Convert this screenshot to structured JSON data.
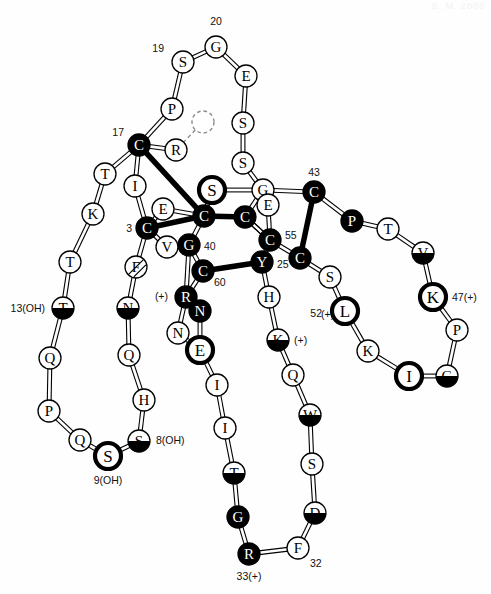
{
  "figure": {
    "type": "protein-residue-topology-diagram",
    "watermark_text": "S. M. 2000",
    "background_color": "#fefefe",
    "stroke_color": "#000000",
    "filled_fill": "#000000",
    "filled_text": "#ffffff",
    "open_fill": "#ffffff",
    "open_text": "#000000"
  },
  "legend": {
    "residue_radius_normal": 11,
    "residue_radius_large": 13,
    "bond_width_normal": 1.1,
    "bond_width_thick": 5.5
  },
  "residues": [
    {
      "id": "r01",
      "label": "G",
      "x": 216,
      "y": 47,
      "style": "open",
      "r": 11,
      "name": "residue-g20"
    },
    {
      "id": "r02",
      "label": "S",
      "x": 183,
      "y": 62,
      "style": "open",
      "r": 11,
      "name": "residue-s19"
    },
    {
      "id": "r03",
      "label": "P",
      "x": 172,
      "y": 109,
      "style": "open",
      "r": 11,
      "name": "residue-p18"
    },
    {
      "id": "r04",
      "label": "C",
      "x": 139,
      "y": 145,
      "style": "filled",
      "r": 11,
      "name": "residue-c17"
    },
    {
      "id": "r05",
      "label": "T",
      "x": 105,
      "y": 174,
      "style": "open",
      "r": 11,
      "name": "residue-t16"
    },
    {
      "id": "r06",
      "label": "K",
      "x": 93,
      "y": 214,
      "style": "open",
      "r": 11,
      "name": "residue-k15"
    },
    {
      "id": "r07",
      "label": "T",
      "x": 70,
      "y": 262,
      "style": "open",
      "r": 11,
      "name": "residue-t14"
    },
    {
      "id": "r08",
      "label": "T",
      "x": 63,
      "y": 308,
      "style": "halffill",
      "r": 11,
      "name": "residue-t13"
    },
    {
      "id": "r09",
      "label": "Q",
      "x": 50,
      "y": 358,
      "style": "open",
      "r": 11,
      "name": "residue-q12"
    },
    {
      "id": "r10",
      "label": "P",
      "x": 49,
      "y": 411,
      "style": "open",
      "r": 11,
      "name": "residue-p11"
    },
    {
      "id": "r11",
      "label": "Q",
      "x": 80,
      "y": 440,
      "style": "open",
      "r": 11,
      "name": "residue-q10"
    },
    {
      "id": "r12",
      "label": "S",
      "x": 108,
      "y": 456,
      "style": "ring",
      "r": 13,
      "name": "residue-s9"
    },
    {
      "id": "r13",
      "label": "S",
      "x": 139,
      "y": 441,
      "style": "halffill",
      "r": 11,
      "name": "residue-s8"
    },
    {
      "id": "r14",
      "label": "H",
      "x": 144,
      "y": 400,
      "style": "open",
      "r": 11,
      "name": "residue-h7"
    },
    {
      "id": "r15",
      "label": "Q",
      "x": 129,
      "y": 355,
      "style": "open",
      "r": 11,
      "name": "residue-q6"
    },
    {
      "id": "r16",
      "label": "N",
      "x": 128,
      "y": 308,
      "style": "halffill",
      "r": 11,
      "name": "residue-n5"
    },
    {
      "id": "r17",
      "label": "F",
      "x": 136,
      "y": 267,
      "style": "hatched",
      "r": 11,
      "name": "residue-f4"
    },
    {
      "id": "r18",
      "label": "C",
      "x": 147,
      "y": 228,
      "style": "filled",
      "r": 11,
      "name": "residue-c3"
    },
    {
      "id": "r19",
      "label": "I",
      "x": 135,
      "y": 186,
      "style": "open",
      "r": 11,
      "name": "residue-i2"
    },
    {
      "id": "r20",
      "label": "E",
      "x": 163,
      "y": 209,
      "style": "open",
      "r": 11,
      "name": "residue-e-side"
    },
    {
      "id": "r21",
      "label": "R",
      "x": 176,
      "y": 150,
      "style": "open",
      "r": 11,
      "name": "residue-r-dashed-link"
    },
    {
      "id": "r22",
      "label": "",
      "x": 203,
      "y": 122,
      "style": "dashed",
      "r": 11,
      "name": "residue-unknown-dashed"
    },
    {
      "id": "r23",
      "label": "E",
      "x": 246,
      "y": 76,
      "style": "open",
      "r": 11,
      "name": "residue-e21"
    },
    {
      "id": "r24",
      "label": "S",
      "x": 243,
      "y": 123,
      "style": "open",
      "r": 11,
      "name": "residue-s22"
    },
    {
      "id": "r25",
      "label": "S",
      "x": 243,
      "y": 163,
      "style": "open",
      "r": 11,
      "name": "residue-s23"
    },
    {
      "id": "r26",
      "label": "G",
      "x": 263,
      "y": 190,
      "style": "open",
      "r": 11,
      "name": "residue-g24"
    },
    {
      "id": "r27",
      "label": "S",
      "x": 212,
      "y": 190,
      "style": "ring",
      "r": 13,
      "name": "residue-s-center"
    },
    {
      "id": "r28",
      "label": "C",
      "x": 204,
      "y": 216,
      "style": "filled",
      "r": 11,
      "name": "residue-c-center-left"
    },
    {
      "id": "r29",
      "label": "C",
      "x": 245,
      "y": 217,
      "style": "filled",
      "r": 11,
      "name": "residue-c-center-right"
    },
    {
      "id": "r30",
      "label": "E",
      "x": 268,
      "y": 205,
      "style": "open",
      "r": 11,
      "name": "residue-e-center"
    },
    {
      "id": "r31",
      "label": "V",
      "x": 167,
      "y": 247,
      "style": "open",
      "r": 11,
      "name": "residue-v-side"
    },
    {
      "id": "r32",
      "label": "G",
      "x": 189,
      "y": 245,
      "style": "filled",
      "r": 11,
      "name": "residue-g40"
    },
    {
      "id": "r33",
      "label": "C",
      "x": 203,
      "y": 271,
      "style": "filled",
      "r": 11,
      "name": "residue-c60"
    },
    {
      "id": "r34",
      "label": "C",
      "x": 270,
      "y": 240,
      "style": "filled",
      "r": 11,
      "name": "residue-c55"
    },
    {
      "id": "r35",
      "label": "Y",
      "x": 262,
      "y": 262,
      "style": "filled",
      "r": 11,
      "name": "residue-y25"
    },
    {
      "id": "r36",
      "label": "H",
      "x": 269,
      "y": 297,
      "style": "open",
      "r": 11,
      "name": "residue-h26"
    },
    {
      "id": "r37",
      "label": "K",
      "x": 278,
      "y": 340,
      "style": "halffill",
      "r": 11,
      "name": "residue-k27"
    },
    {
      "id": "r38",
      "label": "Q",
      "x": 293,
      "y": 375,
      "style": "open",
      "r": 11,
      "name": "residue-q28"
    },
    {
      "id": "r39",
      "label": "W",
      "x": 310,
      "y": 415,
      "style": "halffill",
      "r": 11,
      "name": "residue-w29"
    },
    {
      "id": "r40",
      "label": "S",
      "x": 312,
      "y": 464,
      "style": "open",
      "r": 11,
      "name": "residue-s30"
    },
    {
      "id": "r41",
      "label": "D",
      "x": 315,
      "y": 513,
      "style": "halffill",
      "r": 11,
      "name": "residue-d31"
    },
    {
      "id": "r42",
      "label": "F",
      "x": 298,
      "y": 548,
      "style": "open",
      "r": 11,
      "name": "residue-f32"
    },
    {
      "id": "r43",
      "label": "R",
      "x": 249,
      "y": 554,
      "style": "filled",
      "r": 11,
      "name": "residue-r33"
    },
    {
      "id": "r44",
      "label": "G",
      "x": 238,
      "y": 517,
      "style": "filled",
      "r": 11,
      "name": "residue-g34"
    },
    {
      "id": "r45",
      "label": "T",
      "x": 234,
      "y": 473,
      "style": "halffill",
      "r": 11,
      "name": "residue-t35"
    },
    {
      "id": "r46",
      "label": "I",
      "x": 225,
      "y": 428,
      "style": "open",
      "r": 11,
      "name": "residue-i36"
    },
    {
      "id": "r47",
      "label": "I",
      "x": 217,
      "y": 385,
      "style": "open",
      "r": 11,
      "name": "residue-i37"
    },
    {
      "id": "r48",
      "label": "E",
      "x": 200,
      "y": 350,
      "style": "ring",
      "r": 13,
      "name": "residue-e38"
    },
    {
      "id": "r49",
      "label": "N",
      "x": 178,
      "y": 333,
      "style": "open",
      "r": 11,
      "name": "residue-n39"
    },
    {
      "id": "r50",
      "label": "N",
      "x": 200,
      "y": 311,
      "style": "filled",
      "r": 11,
      "name": "residue-n-side"
    },
    {
      "id": "r51",
      "label": "R",
      "x": 186,
      "y": 297,
      "style": "filled",
      "r": 11,
      "name": "residue-r-plus"
    },
    {
      "id": "r52",
      "label": "C",
      "x": 314,
      "y": 192,
      "style": "filled",
      "r": 11,
      "name": "residue-c43"
    },
    {
      "id": "r53",
      "label": "P",
      "x": 352,
      "y": 221,
      "style": "filled",
      "r": 11,
      "name": "residue-p44"
    },
    {
      "id": "r54",
      "label": "T",
      "x": 388,
      "y": 229,
      "style": "open",
      "r": 11,
      "name": "residue-t45"
    },
    {
      "id": "r55",
      "label": "V",
      "x": 423,
      "y": 253,
      "style": "halffill",
      "r": 11,
      "name": "residue-v46"
    },
    {
      "id": "r56",
      "label": "K",
      "x": 433,
      "y": 297,
      "style": "ring",
      "r": 13,
      "name": "residue-k47"
    },
    {
      "id": "r57",
      "label": "P",
      "x": 457,
      "y": 330,
      "style": "open",
      "r": 11,
      "name": "residue-p48"
    },
    {
      "id": "r58",
      "label": "G",
      "x": 447,
      "y": 376,
      "style": "halffill",
      "r": 11,
      "name": "residue-g49"
    },
    {
      "id": "r59",
      "label": "I",
      "x": 409,
      "y": 376,
      "style": "ring",
      "r": 13,
      "name": "residue-i50"
    },
    {
      "id": "r60",
      "label": "K",
      "x": 368,
      "y": 351,
      "style": "open",
      "r": 11,
      "name": "residue-k51"
    },
    {
      "id": "r61",
      "label": "L",
      "x": 345,
      "y": 311,
      "style": "ring",
      "r": 13,
      "name": "residue-l52"
    },
    {
      "id": "r62",
      "label": "S",
      "x": 330,
      "y": 277,
      "style": "open",
      "r": 11,
      "name": "residue-s53"
    },
    {
      "id": "r63",
      "label": "C",
      "x": 300,
      "y": 258,
      "style": "filled",
      "r": 11,
      "name": "residue-c54"
    }
  ],
  "bonds": [
    {
      "from": "r01",
      "to": "r02",
      "thick": false
    },
    {
      "from": "r02",
      "to": "r03",
      "thick": false
    },
    {
      "from": "r03",
      "to": "r04",
      "thick": false
    },
    {
      "from": "r04",
      "to": "r05",
      "thick": false
    },
    {
      "from": "r05",
      "to": "r06",
      "thick": false
    },
    {
      "from": "r06",
      "to": "r07",
      "thick": false
    },
    {
      "from": "r07",
      "to": "r08",
      "thick": false
    },
    {
      "from": "r08",
      "to": "r09",
      "thick": false
    },
    {
      "from": "r09",
      "to": "r10",
      "thick": false
    },
    {
      "from": "r10",
      "to": "r11",
      "thick": false
    },
    {
      "from": "r11",
      "to": "r12",
      "thick": false
    },
    {
      "from": "r12",
      "to": "r13",
      "thick": false
    },
    {
      "from": "r13",
      "to": "r14",
      "thick": false
    },
    {
      "from": "r14",
      "to": "r15",
      "thick": false
    },
    {
      "from": "r15",
      "to": "r16",
      "thick": false
    },
    {
      "from": "r16",
      "to": "r17",
      "thick": false
    },
    {
      "from": "r17",
      "to": "r18",
      "thick": false
    },
    {
      "from": "r18",
      "to": "r19",
      "thick": false
    },
    {
      "from": "r19",
      "to": "r04",
      "thick": false
    },
    {
      "from": "r18",
      "to": "r20",
      "thick": false
    },
    {
      "from": "r20",
      "to": "r28",
      "thick": false
    },
    {
      "from": "r04",
      "to": "r21",
      "thick": false
    },
    {
      "from": "r21",
      "to": "r22",
      "thick": false,
      "dashed": true
    },
    {
      "from": "r01",
      "to": "r23",
      "thick": false
    },
    {
      "from": "r23",
      "to": "r24",
      "thick": false
    },
    {
      "from": "r24",
      "to": "r25",
      "thick": false
    },
    {
      "from": "r25",
      "to": "r26",
      "thick": false
    },
    {
      "from": "r04",
      "to": "r28",
      "thick": true
    },
    {
      "from": "r27",
      "to": "r28",
      "thick": false
    },
    {
      "from": "r27",
      "to": "r26",
      "thick": false
    },
    {
      "from": "r18",
      "to": "r28",
      "thick": true
    },
    {
      "from": "r28",
      "to": "r29",
      "thick": true
    },
    {
      "from": "r29",
      "to": "r26",
      "thick": false
    },
    {
      "from": "r26",
      "to": "r30",
      "thick": false
    },
    {
      "from": "r30",
      "to": "r34",
      "thick": false
    },
    {
      "from": "r28",
      "to": "r32",
      "thick": false
    },
    {
      "from": "r31",
      "to": "r32",
      "thick": false
    },
    {
      "from": "r31",
      "to": "r18",
      "thick": false
    },
    {
      "from": "r32",
      "to": "r33",
      "thick": false
    },
    {
      "from": "r33",
      "to": "r35",
      "thick": true
    },
    {
      "from": "r29",
      "to": "r34",
      "thick": false
    },
    {
      "from": "r34",
      "to": "r35",
      "thick": false
    },
    {
      "from": "r35",
      "to": "r36",
      "thick": false
    },
    {
      "from": "r36",
      "to": "r37",
      "thick": false
    },
    {
      "from": "r37",
      "to": "r38",
      "thick": false
    },
    {
      "from": "r38",
      "to": "r39",
      "thick": false
    },
    {
      "from": "r39",
      "to": "r40",
      "thick": false
    },
    {
      "from": "r40",
      "to": "r41",
      "thick": false
    },
    {
      "from": "r41",
      "to": "r42",
      "thick": false
    },
    {
      "from": "r42",
      "to": "r43",
      "thick": false
    },
    {
      "from": "r43",
      "to": "r44",
      "thick": false
    },
    {
      "from": "r44",
      "to": "r45",
      "thick": false
    },
    {
      "from": "r45",
      "to": "r46",
      "thick": false
    },
    {
      "from": "r46",
      "to": "r47",
      "thick": false
    },
    {
      "from": "r47",
      "to": "r48",
      "thick": false
    },
    {
      "from": "r48",
      "to": "r50",
      "thick": false
    },
    {
      "from": "r50",
      "to": "r51",
      "thick": false
    },
    {
      "from": "r51",
      "to": "r32",
      "thick": false
    },
    {
      "from": "r48",
      "to": "r49",
      "thick": false
    },
    {
      "from": "r49",
      "to": "r51",
      "thick": false
    },
    {
      "from": "r51",
      "to": "r33",
      "thick": false
    },
    {
      "from": "r26",
      "to": "r52",
      "thick": false
    },
    {
      "from": "r52",
      "to": "r53",
      "thick": false
    },
    {
      "from": "r53",
      "to": "r54",
      "thick": false
    },
    {
      "from": "r54",
      "to": "r55",
      "thick": false
    },
    {
      "from": "r55",
      "to": "r56",
      "thick": false
    },
    {
      "from": "r56",
      "to": "r57",
      "thick": false
    },
    {
      "from": "r57",
      "to": "r58",
      "thick": false
    },
    {
      "from": "r58",
      "to": "r59",
      "thick": false
    },
    {
      "from": "r59",
      "to": "r60",
      "thick": false
    },
    {
      "from": "r60",
      "to": "r61",
      "thick": false
    },
    {
      "from": "r61",
      "to": "r62",
      "thick": false
    },
    {
      "from": "r62",
      "to": "r63",
      "thick": false
    },
    {
      "from": "r63",
      "to": "r52",
      "thick": true
    },
    {
      "from": "r63",
      "to": "r34",
      "thick": false
    },
    {
      "from": "r34",
      "to": "r29",
      "thick": false
    }
  ],
  "number_labels": [
    {
      "text": "20",
      "x": 216,
      "y": 25,
      "anchor": "middle",
      "name": "label-20"
    },
    {
      "text": "19",
      "x": 164,
      "y": 52,
      "anchor": "end",
      "name": "label-19"
    },
    {
      "text": "17",
      "x": 124,
      "y": 136,
      "anchor": "end",
      "name": "label-17"
    },
    {
      "text": "3",
      "x": 132,
      "y": 232,
      "anchor": "end",
      "name": "label-3"
    },
    {
      "text": "13(OH)",
      "x": 45,
      "y": 312,
      "anchor": "end",
      "name": "label-13-oh"
    },
    {
      "text": "9(OH)",
      "x": 108,
      "y": 484,
      "anchor": "middle",
      "name": "label-9-oh"
    },
    {
      "text": "8(OH)",
      "x": 156,
      "y": 444,
      "anchor": "start",
      "name": "label-8-oh"
    },
    {
      "text": "40",
      "x": 204,
      "y": 250,
      "anchor": "start",
      "name": "label-40"
    },
    {
      "text": "60",
      "x": 214,
      "y": 286,
      "anchor": "start",
      "name": "label-60"
    },
    {
      "text": "55",
      "x": 285,
      "y": 239,
      "anchor": "start",
      "name": "label-55"
    },
    {
      "text": "25",
      "x": 277,
      "y": 268,
      "anchor": "start",
      "name": "label-25"
    },
    {
      "text": "43",
      "x": 314,
      "y": 176,
      "anchor": "middle",
      "name": "label-43"
    },
    {
      "text": "47(+)",
      "x": 452,
      "y": 301,
      "anchor": "start",
      "name": "label-47-plus"
    },
    {
      "text": "52",
      "x": 322,
      "y": 317,
      "anchor": "end",
      "name": "label-52"
    },
    {
      "text": "32",
      "x": 310,
      "y": 567,
      "anchor": "start",
      "name": "label-32"
    },
    {
      "text": "33(+)",
      "x": 249,
      "y": 580,
      "anchor": "middle",
      "name": "label-33-plus"
    },
    {
      "text": "(+)",
      "x": 168,
      "y": 300,
      "anchor": "end",
      "name": "label-plus-r"
    },
    {
      "text": "(+)",
      "x": 294,
      "y": 344,
      "anchor": "start",
      "name": "label-plus-k27"
    },
    {
      "text": "(+)",
      "x": 321,
      "y": 318,
      "anchor": "start",
      "name": "label-plus-52-area"
    }
  ]
}
